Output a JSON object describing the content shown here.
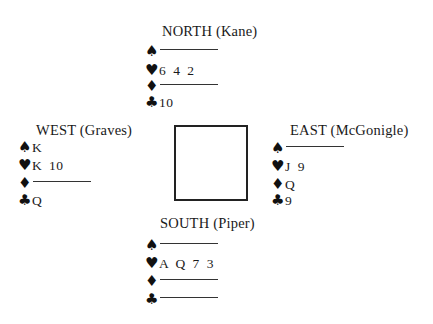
{
  "diagram": {
    "type": "bridge-deal",
    "hands": {
      "north": {
        "title": "NORTH (Kane)",
        "spades": "",
        "hearts": "6 4 2",
        "diamonds": "",
        "clubs": "10"
      },
      "west": {
        "title": "WEST (Graves)",
        "spades": "K",
        "hearts": "K 10",
        "diamonds": "",
        "clubs": "Q"
      },
      "east": {
        "title": "EAST (McGonigle)",
        "spades": "",
        "hearts": "J 9",
        "diamonds": "Q",
        "clubs": "9"
      },
      "south": {
        "title": "SOUTH (Piper)",
        "spades": "",
        "hearts": "A Q 7 3",
        "diamonds": "",
        "clubs": ""
      }
    },
    "suit_icons": {
      "spades": "♠",
      "hearts": "♥",
      "diamonds": "♦",
      "clubs": "♣"
    }
  }
}
